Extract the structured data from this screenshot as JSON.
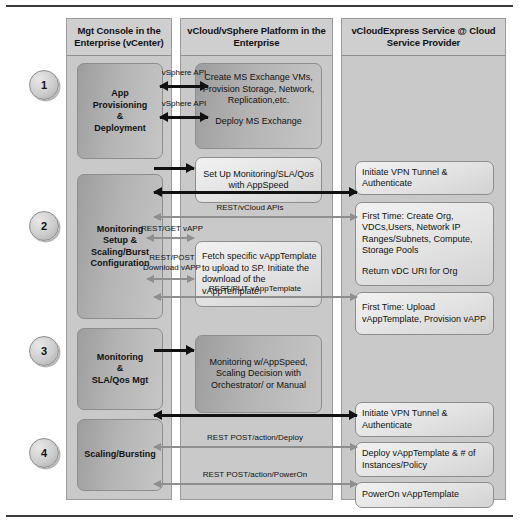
{
  "diagram": {
    "columns": [
      {
        "id": "mgt-console",
        "header": "Mgt Console in the Enterprise (vCenter)"
      },
      {
        "id": "vcloud-platform",
        "header": "vCloud/vSphere Platform in the Enterprise"
      },
      {
        "id": "vcloudexpress-service",
        "header": "vCloudExpress Service @ Cloud Service Provider"
      }
    ],
    "steps": [
      {
        "number": "1"
      },
      {
        "number": "2"
      },
      {
        "number": "3"
      },
      {
        "number": "4"
      }
    ],
    "col1_boxes": [
      {
        "id": "app-provisioning",
        "lines": [
          "App",
          "Provisioning",
          "&",
          "Deployment"
        ]
      },
      {
        "id": "monitoring-setup",
        "lines": [
          "Monitoring",
          "Setup &",
          "Scaling/Burst",
          "Configuration"
        ]
      },
      {
        "id": "monitoring-sla",
        "lines": [
          "Monitoring",
          "&",
          "SLA/Qos Mgt"
        ]
      },
      {
        "id": "scaling-bursting",
        "lines": [
          "Scaling/Bursting"
        ]
      }
    ],
    "col2_boxes": [
      {
        "id": "create-deploy-exchange",
        "paragraphs": [
          "Create MS Exchange VMs, Provision Storage, Network, Replication,etc.",
          "Deploy MS Exchange"
        ]
      },
      {
        "id": "setup-monitoring",
        "paragraphs": [
          "Set Up Monitoring/SLA/Qos with AppSpeed"
        ]
      },
      {
        "id": "fetch-vapptemplate",
        "paragraphs": [
          "Fetch specific vAppTemplate to upload to SP. Initiate the download of the  vAppTemplate."
        ]
      },
      {
        "id": "monitoring-appspeed",
        "paragraphs": [
          "Monitoring w/AppSpeed, Scaling Decision with Orchestrator/ or Manual"
        ]
      }
    ],
    "col3_boxes": [
      {
        "id": "initiate-vpn-1",
        "paragraphs": [
          "Initiate VPN Tunnel & Authenticate"
        ]
      },
      {
        "id": "first-time-create-org",
        "paragraphs": [
          "First Time: Create Org, VDCs,Users, Network IP Ranges/Subnets, Compute, Storage Pools",
          "Return vDC URI for Org"
        ]
      },
      {
        "id": "first-time-upload",
        "paragraphs": [
          "First Time: Upload vAppTemplate, Provision vAPP"
        ]
      },
      {
        "id": "initiate-vpn-2",
        "paragraphs": [
          "Initiate VPN Tunnel & Authenticate"
        ]
      },
      {
        "id": "deploy-vapptemplate",
        "paragraphs": [
          "Deploy vAppTemplate & # of Instances/Policy"
        ]
      },
      {
        "id": "poweron-vapptemplate",
        "paragraphs": [
          "PowerOn vAppTemplate"
        ]
      }
    ],
    "arrow_labels": [
      {
        "id": "vsphere-api-1",
        "text": "vSphere API"
      },
      {
        "id": "vsphere-api-2",
        "text": "vSphere API"
      },
      {
        "id": "rest-vcloud-apis",
        "text": "REST/vCloud APIs"
      },
      {
        "id": "rest-get-vapp",
        "text": "REST/GET vAPP"
      },
      {
        "id": "rest-post-download-vapp",
        "text": "REST/POST Download vAPP"
      },
      {
        "id": "rest-put-vapptemplate",
        "text": "REST/PUT vAppTemplate"
      },
      {
        "id": "rest-post-deploy",
        "text": "REST POST/action/Deploy"
      },
      {
        "id": "rest-post-poweron",
        "text": "REST POST/action/PowerOn"
      }
    ],
    "colors": {
      "column_bg": "#c9c9c9",
      "box_dark": "#adadad",
      "box_light": "#e8e8e8",
      "arrow_black": "#111111",
      "arrow_grey": "#8e8e8e"
    }
  }
}
